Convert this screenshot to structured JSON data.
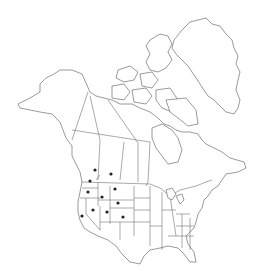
{
  "map": {
    "title": "North America distribution map",
    "region": "North America",
    "colors": {
      "outline": "#555555",
      "dot": "#222222",
      "background": "#ffffff"
    },
    "occurrences": [
      {
        "name": "British Columbia",
        "x": 95,
        "y": 170
      },
      {
        "name": "Alberta",
        "x": 111,
        "y": 174
      },
      {
        "name": "Washington",
        "x": 90,
        "y": 181
      },
      {
        "name": "Montana",
        "x": 115,
        "y": 189
      },
      {
        "name": "Oregon",
        "x": 88,
        "y": 192
      },
      {
        "name": "Idaho",
        "x": 102,
        "y": 197
      },
      {
        "name": "Wyoming",
        "x": 118,
        "y": 203
      },
      {
        "name": "Nevada",
        "x": 93,
        "y": 210
      },
      {
        "name": "Utah",
        "x": 107,
        "y": 212
      },
      {
        "name": "Colorado",
        "x": 123,
        "y": 217
      },
      {
        "name": "California",
        "x": 82,
        "y": 216
      }
    ]
  }
}
